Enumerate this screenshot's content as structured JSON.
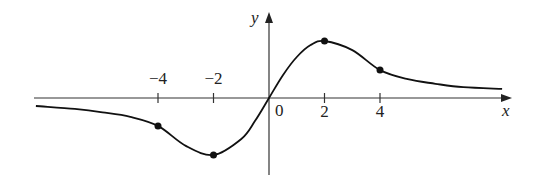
{
  "chart_data": {
    "type": "line",
    "title": "",
    "xlabel": "x",
    "ylabel": "y",
    "x_ticks": [
      {
        "value": -4,
        "label": "−4"
      },
      {
        "value": -2,
        "label": "−2"
      },
      {
        "value": 2,
        "label": "2"
      },
      {
        "value": 4,
        "label": "4"
      }
    ],
    "origin_label": "0",
    "xlim": [
      -8.6,
      8.8
    ],
    "ylim": [
      -1.35,
      1.5
    ],
    "grid": false,
    "legend": null,
    "series": [
      {
        "name": "f(x)",
        "x": [
          -8.4,
          -7,
          -6,
          -5,
          -4,
          -3,
          -2,
          -1,
          -0.5,
          0,
          0.5,
          1,
          1.5,
          2,
          3,
          4,
          5,
          6,
          7,
          8.4
        ],
        "y": [
          -0.14,
          -0.19,
          -0.25,
          -0.33,
          -0.49,
          -0.84,
          -1.0,
          -0.72,
          -0.4,
          0,
          0.4,
          0.72,
          0.93,
          1.0,
          0.84,
          0.49,
          0.33,
          0.25,
          0.19,
          0.16
        ]
      }
    ],
    "marked_points": [
      {
        "x": -4,
        "y": -0.49
      },
      {
        "x": -2,
        "y": -1.0
      },
      {
        "x": 2,
        "y": 1.0
      },
      {
        "x": 4,
        "y": 0.49
      }
    ]
  }
}
